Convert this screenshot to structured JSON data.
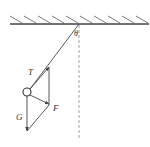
{
  "diagram": {
    "colors": {
      "line": "#444444",
      "dashed": "#9a9a9a",
      "background": "#ffffff"
    },
    "labels": {
      "angle": "θ",
      "tension": "T",
      "force": "F",
      "gravity": "G"
    },
    "elements": [
      {
        "name": "ceiling",
        "type": "hatched-surface"
      },
      {
        "name": "string",
        "from": "pivot",
        "to": "ball"
      },
      {
        "name": "vertical-reference",
        "style": "dashed"
      },
      {
        "name": "ball",
        "type": "circle"
      },
      {
        "name": "tension-vector",
        "label": "T",
        "direction": "along string toward pivot"
      },
      {
        "name": "force-vector",
        "label": "F",
        "direction": "perpendicular, down-right"
      },
      {
        "name": "gravity-vector",
        "label": "G",
        "direction": "straight down"
      }
    ]
  }
}
